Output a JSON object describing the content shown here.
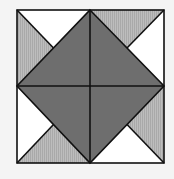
{
  "figure": {
    "square": {
      "x1": 17,
      "y1": 10,
      "x2": 164,
      "y2": 163
    },
    "center": {
      "x": 90,
      "y": 86
    },
    "colors": {
      "background": "#f4f4f4",
      "dark": "#6e6e6e",
      "light": "#b9b9b9",
      "light_hatch": "#a8a8a8",
      "white": "#ffffff",
      "stroke": "#111111"
    },
    "regions": [
      {
        "name": "diamond-top-left",
        "fill": "dark"
      },
      {
        "name": "diamond-top-right",
        "fill": "dark"
      },
      {
        "name": "diamond-bottom-left",
        "fill": "dark"
      },
      {
        "name": "diamond-bottom-right",
        "fill": "dark"
      },
      {
        "name": "corner-tl-top",
        "fill": "white"
      },
      {
        "name": "corner-tl-left",
        "fill": "light"
      },
      {
        "name": "corner-tr-top",
        "fill": "light"
      },
      {
        "name": "corner-tr-right",
        "fill": "white"
      },
      {
        "name": "corner-bl-left",
        "fill": "white"
      },
      {
        "name": "corner-bl-bottom",
        "fill": "light"
      },
      {
        "name": "corner-br-right",
        "fill": "light"
      },
      {
        "name": "corner-br-bottom",
        "fill": "white"
      }
    ]
  }
}
